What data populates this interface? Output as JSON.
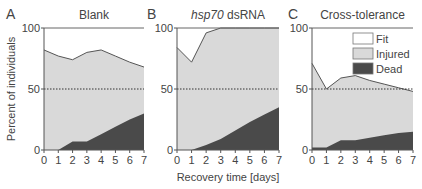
{
  "figure": {
    "ylabel": "Percent of individuals",
    "xlabel": "Recovery time [days]",
    "legend": [
      {
        "label": "Fit",
        "color": "#ffffff"
      },
      {
        "label": "Injured",
        "color": "#d9d9d9"
      },
      {
        "label": "Dead",
        "color": "#4a4a4a"
      }
    ]
  },
  "chart_data": [
    {
      "type": "area",
      "panel": "A",
      "title": "Blank",
      "x": [
        0,
        1,
        2,
        3,
        4,
        5,
        6,
        7
      ],
      "xticks": [
        "0",
        "1",
        "2",
        "3",
        "4",
        "5",
        "6",
        "7"
      ],
      "yticks": [
        "0",
        "50",
        "100"
      ],
      "ylim": [
        0,
        100
      ],
      "xlabel": "",
      "ylabel": "Percent of individuals",
      "reference_line": 50,
      "series": [
        {
          "name": "Dead",
          "values": [
            0,
            0,
            7,
            7,
            13,
            19,
            25,
            30
          ]
        },
        {
          "name": "Injured",
          "values": [
            82,
            77,
            67,
            73,
            69,
            58,
            47,
            38
          ]
        },
        {
          "name": "Fit",
          "values": [
            18,
            23,
            26,
            20,
            18,
            23,
            28,
            32
          ]
        }
      ],
      "upper_boundary": [
        82,
        77,
        74,
        80,
        82,
        77,
        72,
        68
      ]
    },
    {
      "type": "area",
      "panel": "B",
      "title": "hsp70 dsRNA",
      "x": [
        0,
        1,
        2,
        3,
        4,
        5,
        6,
        7
      ],
      "xticks": [
        "0",
        "1",
        "2",
        "3",
        "4",
        "5",
        "6",
        "7"
      ],
      "yticks": [
        "0",
        "50",
        "100"
      ],
      "ylim": [
        0,
        100
      ],
      "xlabel": "Recovery time [days]",
      "ylabel": "",
      "reference_line": 50,
      "series": [
        {
          "name": "Dead",
          "values": [
            0,
            0,
            4,
            9,
            16,
            23,
            29,
            35
          ]
        },
        {
          "name": "Injured",
          "values": [
            84,
            72,
            92,
            91,
            84,
            77,
            71,
            65
          ]
        },
        {
          "name": "Fit",
          "values": [
            16,
            28,
            4,
            0,
            0,
            0,
            0,
            0
          ]
        }
      ],
      "upper_boundary": [
        84,
        72,
        96,
        100,
        100,
        100,
        100,
        100
      ]
    },
    {
      "type": "area",
      "panel": "C",
      "title": "Cross-tolerance",
      "x": [
        0,
        1,
        2,
        3,
        4,
        5,
        6,
        7
      ],
      "xticks": [
        "0",
        "1",
        "2",
        "3",
        "4",
        "5",
        "6",
        "7"
      ],
      "yticks": [
        "0",
        "50",
        "100"
      ],
      "ylim": [
        0,
        100
      ],
      "xlabel": "",
      "ylabel": "",
      "reference_line": 50,
      "legend": [
        "Fit",
        "Injured",
        "Dead"
      ],
      "series": [
        {
          "name": "Dead",
          "values": [
            2,
            2,
            8,
            8,
            10,
            12,
            14,
            15
          ]
        },
        {
          "name": "Injured",
          "values": [
            69,
            48,
            51,
            53,
            47,
            42,
            37,
            33
          ]
        },
        {
          "name": "Fit",
          "values": [
            29,
            50,
            41,
            39,
            43,
            46,
            49,
            52
          ]
        }
      ],
      "upper_boundary": [
        71,
        50,
        59,
        61,
        57,
        54,
        51,
        48
      ]
    }
  ]
}
